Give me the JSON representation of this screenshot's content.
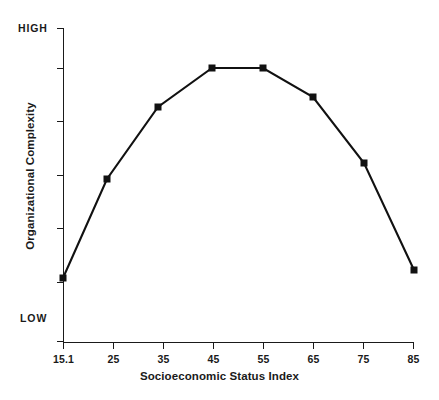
{
  "chart_data": {
    "type": "line",
    "title": "",
    "xlabel": "Socioeconomic Status Index",
    "ylabel": "Organizational Complexity",
    "x_tick_labels": [
      "15.1",
      "25",
      "35",
      "45",
      "55",
      "65",
      "75",
      "85"
    ],
    "y_tick_labels": [
      "HIGH",
      "",
      "",
      "",
      "",
      "",
      "LOW"
    ],
    "y_axis_high_label": "HIGH",
    "y_axis_low_label": "LOW",
    "grid": false,
    "legend": null,
    "ylim": [
      0,
      6
    ],
    "y_axis_note": "Ordinal scale, unlabeled ticks between LOW and HIGH",
    "categories": [
      "15.1",
      "25",
      "35",
      "45",
      "55",
      "65",
      "75",
      "85"
    ],
    "x": [
      15.1,
      25,
      35,
      45,
      55,
      65,
      75,
      85
    ],
    "values": [
      0.55,
      2.6,
      3.95,
      4.75,
      4.75,
      4.35,
      3.15,
      0.8
    ],
    "marker": "square",
    "marker_color": "#111111",
    "line_color": "#111111",
    "background_color": "#ffffff",
    "series": [
      {
        "name": "Organizational Complexity",
        "values": [
          0.55,
          2.6,
          3.95,
          4.75,
          4.75,
          4.35,
          3.15,
          0.8
        ]
      }
    ],
    "points": [
      {
        "x_label": "15.1",
        "px": 63,
        "py": 278
      },
      {
        "x_label": "25",
        "px": 107,
        "py": 179
      },
      {
        "x_label": "35",
        "px": 158,
        "py": 107
      },
      {
        "x_label": "45",
        "px": 212,
        "py": 68
      },
      {
        "x_label": "55",
        "px": 263,
        "py": 68
      },
      {
        "x_label": "65",
        "px": 313,
        "py": 97
      },
      {
        "x_label": "75",
        "px": 364,
        "py": 163
      },
      {
        "x_label": "85",
        "px": 414,
        "py": 270
      }
    ],
    "axis_geometry": {
      "x0": 63,
      "x1": 414,
      "y_top": 28,
      "y_bottom": 342,
      "y_ticks_px": [
        28,
        68,
        121,
        175,
        228,
        282,
        342
      ]
    }
  },
  "axis": {
    "x_title": "Socioeconomic Status Index",
    "y_title": "Organizational Complexity",
    "y_high": "HIGH",
    "y_low": "LOW",
    "x_ticks": {
      "t0": "15.1",
      "t1": "25",
      "t2": "35",
      "t3": "45",
      "t4": "55",
      "t5": "65",
      "t6": "75",
      "t7": "85"
    }
  }
}
